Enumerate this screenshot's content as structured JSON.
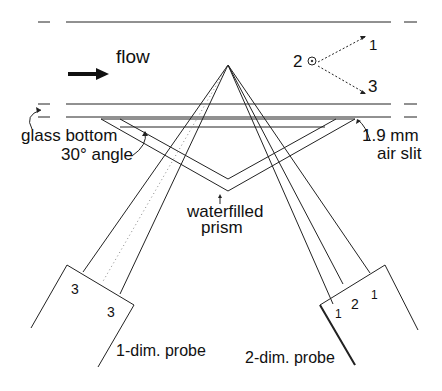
{
  "labels": {
    "flow": "flow",
    "glass_bottom": "glass bottom",
    "angle": "30° angle",
    "prism_line1": "waterfilled",
    "prism_line2": "prism",
    "air_slit_line1": "1.9 mm",
    "air_slit_line2": "air slit",
    "probe1": "1-dim. probe",
    "probe2": "2-dim. probe"
  },
  "components": {
    "one": "1",
    "two": "2",
    "three": "3"
  },
  "probe1_numbers": [
    "3",
    "3"
  ],
  "probe2_numbers": [
    "1",
    "2",
    "1"
  ],
  "colors": {
    "line": "#222222",
    "background": "#ffffff"
  }
}
